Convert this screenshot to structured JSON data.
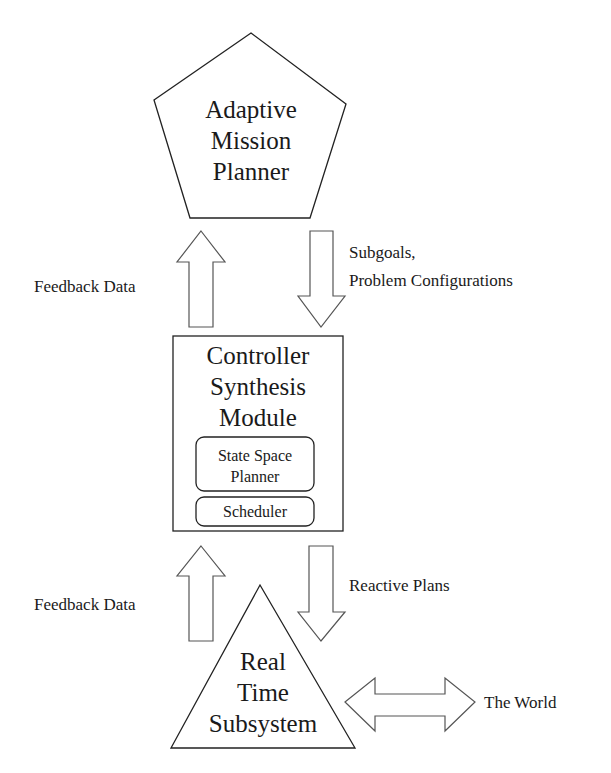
{
  "diagram": {
    "top_node": {
      "shape": "pentagon",
      "lines": [
        "Adaptive",
        "Mission",
        "Planner"
      ]
    },
    "middle_node": {
      "shape": "rectangle",
      "lines": [
        "Controller",
        "Synthesis",
        "Module"
      ],
      "subcomponents": [
        {
          "lines": [
            "State Space",
            "Planner"
          ]
        },
        {
          "lines": [
            "Scheduler"
          ]
        }
      ]
    },
    "bottom_node": {
      "shape": "triangle",
      "lines": [
        "Real",
        "Time",
        "Subsystem"
      ]
    },
    "edges": {
      "upper_feedback": {
        "direction": "up",
        "label": "Feedback Data"
      },
      "upper_command": {
        "direction": "down",
        "label_lines": [
          "Subgoals,",
          "Problem Configurations"
        ]
      },
      "lower_feedback": {
        "direction": "up",
        "label": "Feedback Data"
      },
      "lower_command": {
        "direction": "down",
        "label": "Reactive Plans"
      },
      "world_link": {
        "direction": "bidirectional",
        "label": "The World"
      }
    }
  }
}
